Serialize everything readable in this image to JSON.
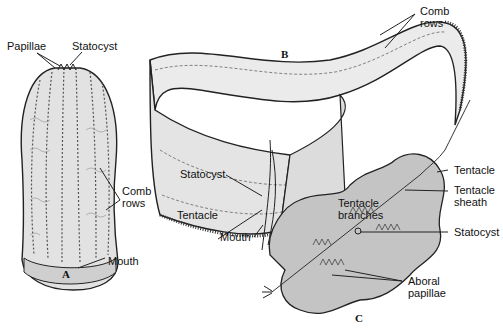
{
  "figure": {
    "panels": [
      {
        "id": "A",
        "label": "A",
        "callouts": [
          "Papillae",
          "Statocyst",
          "Comb rows",
          "Mouth"
        ]
      },
      {
        "id": "B",
        "label": "B",
        "callouts": [
          "Comb rows",
          "Statocyst",
          "Tentacle branches",
          "Tentacle",
          "Mouth"
        ]
      },
      {
        "id": "C",
        "label": "C",
        "callouts": [
          "Tentacle",
          "Tentacle sheath",
          "Statocyst",
          "Aboral papillae"
        ]
      }
    ],
    "labels": {
      "a_papillae": "Papillae",
      "a_statocyst": "Statocyst",
      "a_comb_rows_1": "Comb",
      "a_comb_rows_2": "rows",
      "a_mouth": "Mouth",
      "b_comb_rows_1": "Comb",
      "b_comb_rows_2": "rows",
      "b_statocyst": "Statocyst",
      "b_tentacle_branches_1": "Tentacle",
      "b_tentacle_branches_2": "branches",
      "b_tentacle": "Tentacle",
      "b_mouth": "Mouth",
      "c_tentacle": "Tentacle",
      "c_tentacle_sheath_1": "Tentacle",
      "c_tentacle_sheath_2": "sheath",
      "c_statocyst": "Statocyst",
      "c_aboral_papillae_1": "Aboral",
      "c_aboral_papillae_2": "papillae"
    },
    "panel_letters": {
      "a": "A",
      "b": "B",
      "c": "C"
    },
    "colors": {
      "outline": "#222222",
      "fill_light": "#e9e9e9",
      "fill_mid": "#c8c8c8",
      "fill_dark": "#a9a9a9"
    }
  }
}
